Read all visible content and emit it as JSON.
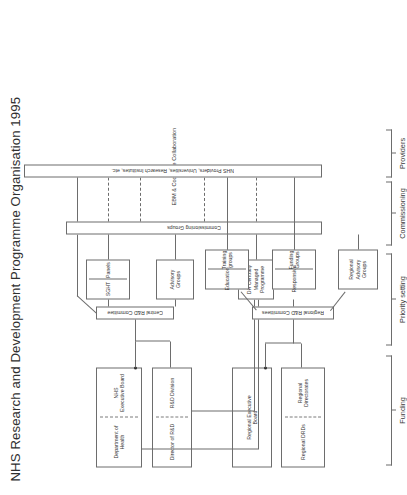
{
  "title": "NHS Research and Development Programme Organisation 1995",
  "nodes": {
    "department_of_health": "Department of Health",
    "nhs_executive_board": "NHS\nExecutive Board",
    "director_of_rd": "Director of R&D",
    "rd_division": "R&D Division",
    "regional_executive_board": "Regional Executive\nBoard",
    "regional_drds": "Regional DRDs",
    "regional_directorates": "Regional Directorates",
    "regional_rd_committees": "Regional R&D Committees",
    "central_rd_committee": "Central R&D Committee",
    "education": "Education",
    "training_groups": "Training\ngroups",
    "responsive": "Responsive",
    "funding_groups": "Funding\nGroups",
    "regional_advisory_groups": "Regional\nAdvisory\nGroups",
    "sght": "SGHT",
    "panels": "Panels",
    "advisory_groups": "Advisory\nGroups",
    "dh_centrally_managed_programme": "DH Centrally\nManaged\nProgramme",
    "commissioning_groups": "Commissioning Groups",
    "providers_bar": "NHS Providers, Universities, Research Institutes, etc.",
    "ebm_cochrane": "EBM & Cochrane Collaboration"
  },
  "bands": [
    {
      "id": "funding",
      "label": "Funding"
    },
    {
      "id": "priority_setting",
      "label": "Priority setting"
    },
    {
      "id": "commissioning",
      "label": "Commissioning"
    },
    {
      "id": "providers",
      "label": "Providers"
    }
  ],
  "colors": {
    "line": "#6d6d6d",
    "text": "#2b2b2b",
    "background": "#ffffff"
  }
}
